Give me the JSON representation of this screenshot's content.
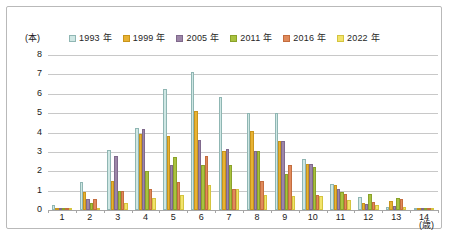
{
  "chart_data": {
    "type": "bar",
    "title": "",
    "xlabel": "(歳)",
    "ylabel": "(本)",
    "ylim": [
      0,
      8
    ],
    "yticks": [
      0,
      1,
      2,
      3,
      4,
      5,
      6,
      7,
      8
    ],
    "categories": [
      "1",
      "2",
      "3",
      "4",
      "5",
      "6",
      "7",
      "8",
      "9",
      "10",
      "11",
      "12",
      "13",
      "14"
    ],
    "grid": true,
    "legend_position": "top",
    "series": [
      {
        "name": "1993 年",
        "color": "#cfe7e4",
        "border": "#8fb6b3",
        "values": [
          0.25,
          1.45,
          3.1,
          4.25,
          6.25,
          7.1,
          5.85,
          5.0,
          5.0,
          2.65,
          1.35,
          0.65,
          0.15,
          0.05
        ]
      },
      {
        "name": "1999 年",
        "color": "#e8b233",
        "border": "#c9951c",
        "values": [
          0.1,
          0.95,
          1.5,
          3.9,
          3.8,
          5.1,
          3.05,
          4.1,
          3.55,
          2.35,
          1.3,
          0.35,
          0.45,
          0.05
        ]
      },
      {
        "name": "2005 年",
        "color": "#9d86a8",
        "border": "#80698c",
        "values": [
          0.05,
          0.55,
          2.8,
          4.2,
          2.3,
          3.6,
          3.15,
          3.05,
          3.55,
          2.35,
          1.1,
          0.3,
          0.2,
          0.03
        ]
      },
      {
        "name": "2011 年",
        "color": "#a9c23f",
        "border": "#8aa22a",
        "values": [
          0.05,
          0.35,
          1.0,
          2.0,
          2.75,
          2.3,
          2.3,
          3.05,
          1.85,
          2.2,
          0.95,
          0.85,
          0.6,
          0.03
        ]
      },
      {
        "name": "2016 年",
        "color": "#e08a5b",
        "border": "#c46d3f",
        "values": [
          0.1,
          0.55,
          1.0,
          1.1,
          1.45,
          2.8,
          1.1,
          1.5,
          2.3,
          0.75,
          0.85,
          0.4,
          0.55,
          0.03
        ]
      },
      {
        "name": "2022 年",
        "color": "#f2e36a",
        "border": "#d4c43f",
        "values": [
          0.03,
          0.1,
          0.35,
          0.6,
          0.75,
          1.3,
          1.1,
          0.75,
          0.7,
          0.7,
          0.5,
          0.25,
          0.15,
          0.02
        ]
      }
    ]
  }
}
